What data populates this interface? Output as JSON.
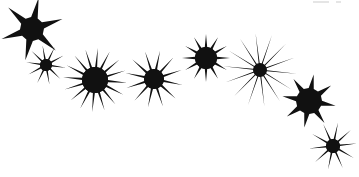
{
  "document": {
    "title": "Star Sparkles Graphic",
    "width": 359,
    "height": 177,
    "background_color": "#ffffff",
    "ink_color": "#111111"
  },
  "artwork": {
    "name": "starburst-cluster",
    "description": "Eight black star / sparkle bursts arranged along a descending diagonal band from upper-left to lower-right on a white background",
    "shape_count": 8,
    "shapes": [
      {
        "id": "star-1",
        "label": "six-point star",
        "kind": "star",
        "points": 6,
        "cx": 32,
        "cy": 29,
        "outer_r": 32,
        "inner_r": 12,
        "rotation": -18,
        "spike_sharpness": 0.34,
        "color": "#111111"
      },
      {
        "id": "star-2",
        "label": "ten-point small burst",
        "kind": "burst",
        "points": 10,
        "cx": 46,
        "cy": 65,
        "outer_r": 20,
        "inner_r": 6,
        "rotation": 8,
        "spike_sharpness": 0.18,
        "color": "#111111"
      },
      {
        "id": "star-3",
        "label": "sixteen-point dense burst",
        "kind": "burst",
        "points": 16,
        "cx": 95,
        "cy": 80,
        "outer_r": 32,
        "inner_r": 13,
        "rotation": 5,
        "spike_sharpness": 0.14,
        "color": "#111111"
      },
      {
        "id": "star-4",
        "label": "twelve-point burst",
        "kind": "burst",
        "points": 12,
        "cx": 154,
        "cy": 79,
        "outer_r": 29,
        "inner_r": 10,
        "rotation": 12,
        "spike_sharpness": 0.15,
        "color": "#111111"
      },
      {
        "id": "star-5",
        "label": "twelve-point compact burst",
        "kind": "burst",
        "points": 12,
        "cx": 206,
        "cy": 58,
        "outer_r": 24,
        "inner_r": 11,
        "rotation": 0,
        "spike_sharpness": 0.17,
        "color": "#111111"
      },
      {
        "id": "star-6",
        "label": "long-ray sparkle",
        "kind": "sparkle",
        "points": 14,
        "cx": 260,
        "cy": 70,
        "outer_r": 37,
        "inner_r": 7,
        "rotation": 6,
        "spike_sharpness": 0.05,
        "color": "#111111"
      },
      {
        "id": "star-7",
        "label": "eight-point star",
        "kind": "star",
        "points": 8,
        "cx": 309,
        "cy": 101,
        "outer_r": 27,
        "inner_r": 13,
        "rotation": 10,
        "spike_sharpness": 0.3,
        "color": "#111111"
      },
      {
        "id": "star-8",
        "label": "ten-point thin burst",
        "kind": "burst",
        "points": 10,
        "cx": 333,
        "cy": 146,
        "outer_r": 24,
        "inner_r": 7,
        "rotation": -6,
        "spike_sharpness": 0.12,
        "color": "#111111"
      }
    ],
    "artifacts": [
      {
        "id": "artifact-1",
        "label": "scan smudge",
        "x": 313,
        "y": 1,
        "w": 16,
        "h": 2,
        "color": "#cfcfcf"
      },
      {
        "id": "artifact-2",
        "label": "scan speck",
        "x": 336,
        "y": 1,
        "w": 5,
        "h": 2,
        "color": "#cfcfcf"
      }
    ]
  }
}
